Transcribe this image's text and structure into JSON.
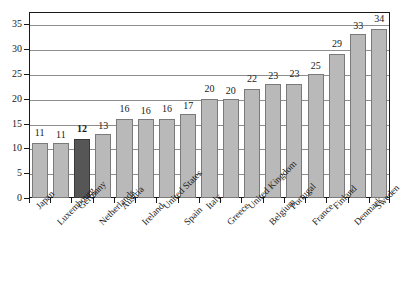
{
  "chart_data": {
    "type": "bar",
    "title": "",
    "subtitle": "",
    "xlabel": "",
    "ylabel": "",
    "ylim": [
      0,
      37.5
    ],
    "yticks": [
      0,
      5,
      10,
      15,
      20,
      25,
      30,
      35
    ],
    "ytick_labels": [
      "0",
      "5",
      "10",
      "15",
      "20",
      "25",
      "30",
      "35"
    ],
    "grid": true,
    "legend": null,
    "categories": [
      "Japan",
      "Luxembourg",
      "Germany",
      "Netherlands",
      "Austria",
      "Ireland",
      "United States",
      "Spain",
      "Italy",
      "Greece",
      "United Kingdom",
      "Belgium",
      "Portugal",
      "France",
      "Finland",
      "Denmark",
      "Sweden"
    ],
    "values": [
      11,
      11,
      12,
      13,
      16,
      16,
      16,
      17,
      20,
      20,
      22,
      23,
      23,
      25,
      29,
      33,
      34
    ],
    "value_labels": [
      "11",
      "11",
      "12",
      "13",
      "16",
      "16",
      "16",
      "17",
      "20",
      "20",
      "22",
      "23",
      "23",
      "25",
      "29",
      "33",
      "34"
    ],
    "highlighted_category": "Germany",
    "highlight_index": 2,
    "colors": {
      "bar_fill": "#b9b9b9",
      "bar_border": "#7a7a7a",
      "highlight_fill": "#565656",
      "highlight_border": "#3a3a3a",
      "gridline": "#8e8e8e",
      "axis": "#1a1a1a",
      "background": "#ffffff",
      "text": "#1a1a1a"
    }
  }
}
